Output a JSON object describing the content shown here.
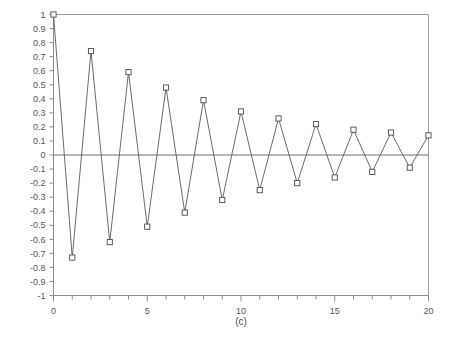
{
  "chart_data": {
    "type": "line",
    "title": "",
    "subtitle": "",
    "caption": "(c)",
    "xlabel": "",
    "ylabel": "",
    "xlim": [
      0,
      20
    ],
    "ylim": [
      -1,
      1
    ],
    "grid": false,
    "legend": null,
    "marker": "open-square",
    "x": [
      0,
      1,
      2,
      3,
      4,
      5,
      6,
      7,
      8,
      9,
      10,
      11,
      12,
      13,
      14,
      15,
      16,
      17,
      18,
      19,
      20
    ],
    "values": [
      1,
      -0.73,
      0.74,
      -0.62,
      0.59,
      -0.51,
      0.48,
      -0.41,
      0.39,
      -0.32,
      0.31,
      -0.25,
      0.26,
      -0.2,
      0.22,
      -0.16,
      0.18,
      -0.12,
      0.16,
      -0.09,
      0.14
    ],
    "series": [
      {
        "name": "series-1",
        "values": [
          1,
          -0.73,
          0.74,
          -0.62,
          0.59,
          -0.51,
          0.48,
          -0.41,
          0.39,
          -0.32,
          0.31,
          -0.25,
          0.26,
          -0.2,
          0.22,
          -0.16,
          0.18,
          -0.12,
          0.16,
          -0.09,
          0.14
        ]
      }
    ],
    "x_ticks_major": [
      0,
      5,
      10,
      15,
      20
    ],
    "x_tick_labels": [
      "0",
      "5",
      "10",
      "15",
      "20"
    ],
    "x_ticks_minor": [
      1,
      2,
      3,
      4,
      6,
      7,
      8,
      9,
      11,
      12,
      13,
      14,
      16,
      17,
      18,
      19
    ],
    "y_ticks": [
      1,
      0.9,
      0.8,
      0.7,
      0.6,
      0.5,
      0.4,
      0.3,
      0.2,
      0.1,
      0,
      -0.1,
      -0.2,
      -0.3,
      -0.4,
      -0.5,
      -0.6,
      -0.7,
      -0.8,
      -0.9,
      -1
    ],
    "y_tick_labels": [
      "1",
      "0.9",
      "0.8",
      "0.7",
      "0.6",
      "0.5",
      "0.4",
      "0.3",
      "0.2",
      "0.1",
      "0",
      "-0.1",
      "-0.2",
      "-0.3",
      "-0.4",
      "-0.5",
      "-0.6",
      "-0.7",
      "-0.8",
      "-0.9",
      "-1"
    ],
    "colors": {
      "line": "#5a5a5a",
      "marker_stroke": "#4a4a4a",
      "marker_fill": "#ffffff",
      "axis": "#8c8c8c",
      "text": "#555555",
      "background": "#ffffff"
    }
  }
}
